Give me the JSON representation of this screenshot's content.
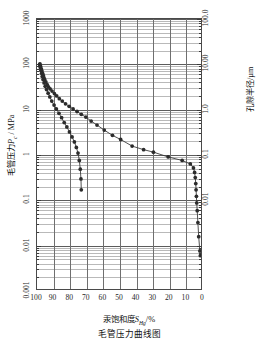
{
  "chart_data": {
    "type": "line",
    "title": "毛管压力曲线图",
    "xlabel": "汞饱和度S_Hg/%",
    "ylabel": "毛管压力Pc / MPa",
    "ylabel_right": "孔隙半径/µm",
    "grid": true,
    "legend_position": "none",
    "xlim": [
      100,
      0
    ],
    "x_reversed": true,
    "xticks": [
      100,
      90,
      80,
      70,
      60,
      50,
      40,
      30,
      20,
      10,
      0
    ],
    "xticklabels": [
      "100",
      "90",
      "80",
      "70",
      "60",
      "50",
      "40",
      "30",
      "20",
      "10",
      "0"
    ],
    "yscale": "log",
    "ylim": [
      0.001,
      1000
    ],
    "yticks": [
      0.001,
      0.01,
      0.1,
      1,
      10,
      100,
      1000
    ],
    "yticklabels": [
      "0.001",
      "0.01",
      "0.1",
      "1",
      "10",
      "100",
      "1000"
    ],
    "y2scale": "log",
    "y2lim": [
      100.0,
      0.01
    ],
    "y2ticks": [
      100.0,
      10.0,
      1.0,
      0.1,
      0.01
    ],
    "y2ticklabels": [
      "100.0",
      "10.00",
      "1.0",
      "0.1",
      "0.01"
    ],
    "series": [
      {
        "name": "curve-a",
        "marker": "filled-circle",
        "color": "#2b2b2b",
        "points": [
          [
            98.2,
            100.0
          ],
          [
            97.8,
            88.0
          ],
          [
            97.4,
            78.0
          ],
          [
            97.0,
            70.0
          ],
          [
            96.6,
            62.0
          ],
          [
            96.2,
            56.0
          ],
          [
            95.8,
            50.0
          ],
          [
            95.3,
            45.0
          ],
          [
            94.6,
            40.0
          ],
          [
            93.8,
            35.0
          ],
          [
            93.0,
            31.0
          ],
          [
            92.0,
            28.0
          ],
          [
            90.8,
            25.0
          ],
          [
            89.4,
            22.0
          ],
          [
            88.0,
            19.5
          ],
          [
            86.4,
            17.0
          ],
          [
            84.6,
            15.0
          ],
          [
            82.6,
            13.0
          ],
          [
            80.4,
            11.5
          ],
          [
            78.0,
            10.0
          ],
          [
            75.6,
            8.8
          ],
          [
            73.0,
            7.6
          ],
          [
            70.2,
            6.6
          ],
          [
            67.0,
            5.4
          ],
          [
            63.4,
            4.4
          ],
          [
            59.0,
            3.4
          ],
          [
            54.0,
            2.6
          ],
          [
            49.0,
            2.1
          ],
          [
            42.0,
            1.5
          ],
          [
            35.0,
            1.25
          ],
          [
            29.0,
            1.1
          ],
          [
            20.0,
            0.86
          ],
          [
            11.5,
            0.72
          ],
          [
            6.5,
            0.6
          ],
          [
            4.6,
            0.49
          ],
          [
            3.9,
            0.39
          ],
          [
            3.5,
            0.3
          ],
          [
            3.2,
            0.22
          ],
          [
            3.0,
            0.16
          ],
          [
            2.8,
            0.115
          ],
          [
            2.6,
            0.082
          ],
          [
            2.3,
            0.055
          ],
          [
            1.9,
            0.03
          ],
          [
            1.4,
            0.0145
          ],
          [
            0.7,
            0.007
          ],
          [
            0.4,
            0.0055
          ]
        ]
      },
      {
        "name": "curve-b",
        "marker": "filled-circle",
        "color": "#2b2b2b",
        "points": [
          [
            98.4,
            98.0
          ],
          [
            98.0,
            84.0
          ],
          [
            97.6,
            72.0
          ],
          [
            97.2,
            62.0
          ],
          [
            96.8,
            53.0
          ],
          [
            96.3,
            45.0
          ],
          [
            95.7,
            38.0
          ],
          [
            95.0,
            32.0
          ],
          [
            94.2,
            27.0
          ],
          [
            93.2,
            22.5
          ],
          [
            92.2,
            18.5
          ],
          [
            91.0,
            15.0
          ],
          [
            89.6,
            12.2
          ],
          [
            88.2,
            10.0
          ],
          [
            86.6,
            8.0
          ],
          [
            85.0,
            6.4
          ],
          [
            83.4,
            5.0
          ],
          [
            81.8,
            4.0
          ],
          [
            80.2,
            3.1
          ],
          [
            78.6,
            2.4
          ],
          [
            77.2,
            1.85
          ],
          [
            76.0,
            1.4
          ],
          [
            75.0,
            1.05
          ],
          [
            74.2,
            0.72
          ],
          [
            73.6,
            0.46
          ],
          [
            73.2,
            0.28
          ],
          [
            73.0,
            0.16
          ]
        ]
      }
    ]
  },
  "labels": {
    "x_label_prefix": "汞饱和度",
    "x_label_sym": "S",
    "x_label_sub": "Hg",
    "x_label_suffix": "/%",
    "y_label_prefix": "毛管压力",
    "y_label_sym": "P",
    "y_label_sub": "c",
    "y_label_suffix": " / MPa",
    "y2_label": "孔隙半径/µm",
    "title": "毛管压力曲线图"
  },
  "colors": {
    "frame": "#4a4a4a",
    "grid_major": "#5c5c5c",
    "grid_minor": "#b9b9b9",
    "marker": "#2b2b2b",
    "line": "#3a3a3a",
    "text": "#1a1a1a",
    "background": "#ffffff"
  }
}
